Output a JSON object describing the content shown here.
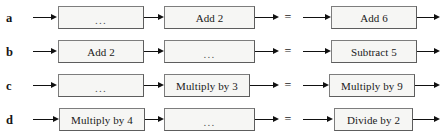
{
  "diagram": {
    "ellipsis": "...",
    "equals": "=",
    "rows": [
      {
        "label": "a",
        "left_box": "...",
        "middle_box": "Add 2",
        "result_box": "Add 6"
      },
      {
        "label": "b",
        "left_box": "Add 2",
        "middle_box": "...",
        "result_box": "Subtract 5"
      },
      {
        "label": "c",
        "left_box": "...",
        "middle_box": "Multiply by 3",
        "result_box": "Multiply by 9"
      },
      {
        "label": "d",
        "left_box": "Multiply by 4",
        "middle_box": "...",
        "result_box": "Divide by 2"
      }
    ],
    "colors": {
      "background": "#ffffff",
      "box_fill": "#f6f6f4",
      "box_border": "#7d7d7d",
      "arrow": "#111111",
      "text": "#1a1a1a"
    }
  }
}
